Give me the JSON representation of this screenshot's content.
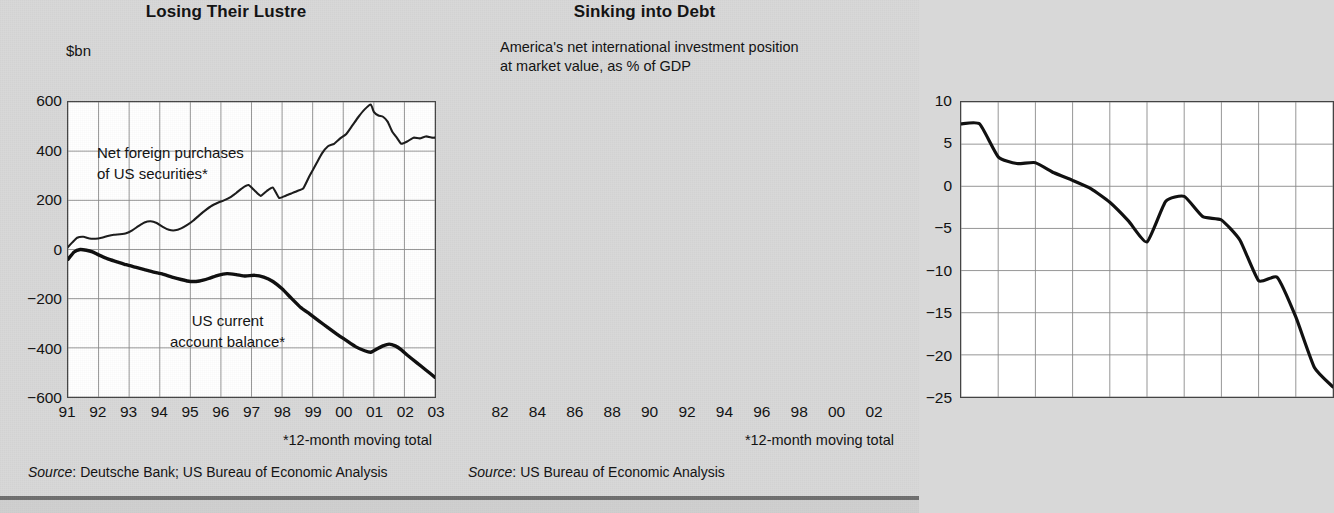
{
  "background_color": "#d8d8d8",
  "ink_color": "#111111",
  "grid_color": "#8a8a8a",
  "panels": [
    {
      "title": "Losing Their Lustre",
      "unit_label": "$bn",
      "footnote": "*12-month moving total",
      "source_prefix": "Source",
      "source_text": ": Deutsche Bank; US Bureau of Economic Analysis"
    },
    {
      "title": "Sinking into Debt",
      "subtitle_line1": "America's net international investment position",
      "subtitle_line2": "at market value, as % of GDP",
      "footnote": "*12-month moving total",
      "source_prefix": "Source",
      "source_text": ": US Bureau of Economic Analysis"
    }
  ],
  "chart_data": [
    {
      "type": "line",
      "title": "Losing Their Lustre",
      "ylabel": "$bn",
      "xlabel": "",
      "ylim": [
        -600,
        600
      ],
      "yticks": [
        600,
        400,
        200,
        0,
        -200,
        -400,
        -600
      ],
      "ytick_labels": [
        "600",
        "400",
        "200",
        "0",
        "−200",
        "−400",
        "−600"
      ],
      "xlim": [
        1991,
        2003
      ],
      "xticks": [
        1991,
        1992,
        1993,
        1994,
        1995,
        1996,
        1997,
        1998,
        1999,
        2000,
        2001,
        2002,
        2003
      ],
      "xtick_labels": [
        "91",
        "92",
        "93",
        "94",
        "95",
        "96",
        "97",
        "98",
        "99",
        "00",
        "01",
        "02",
        "03"
      ],
      "grid": true,
      "legend_position": "inline-annotation",
      "annotations": [
        {
          "text": "Net foreign purchases\nof US securities*",
          "x": 1993.3,
          "y": 400
        },
        {
          "text": "US current\naccount balance*",
          "x": 1995.6,
          "y": -290
        }
      ],
      "series": [
        {
          "name": "Net foreign purchases of US securities*",
          "label": "Net foreign purchases\nof US securities*",
          "units": "$bn, 12-month moving total",
          "x": [
            1991.0,
            1991.15,
            1991.3,
            1991.5,
            1991.7,
            1991.9,
            1992.1,
            1992.3,
            1992.5,
            1992.7,
            1992.9,
            1993.1,
            1993.3,
            1993.5,
            1993.7,
            1993.9,
            1994.1,
            1994.3,
            1994.5,
            1994.7,
            1994.9,
            1995.1,
            1995.3,
            1995.5,
            1995.7,
            1995.9,
            1996.1,
            1996.3,
            1996.5,
            1996.7,
            1996.9,
            1997.1,
            1997.3,
            1997.5,
            1997.7,
            1997.9,
            1998.1,
            1998.3,
            1998.5,
            1998.7,
            1998.9,
            1999.1,
            1999.3,
            1999.5,
            1999.7,
            1999.9,
            2000.1,
            2000.3,
            2000.5,
            2000.7,
            2000.9,
            2001.0,
            2001.15,
            2001.3,
            2001.45,
            2001.6,
            2001.75,
            2001.9,
            2002.1,
            2002.3,
            2002.5,
            2002.7,
            2002.9,
            2003.0
          ],
          "y": [
            10,
            30,
            48,
            52,
            45,
            44,
            48,
            55,
            60,
            62,
            66,
            78,
            95,
            110,
            115,
            108,
            92,
            80,
            78,
            86,
            100,
            118,
            140,
            160,
            178,
            190,
            200,
            212,
            230,
            250,
            262,
            240,
            218,
            238,
            252,
            210,
            218,
            228,
            238,
            250,
            300,
            345,
            390,
            420,
            430,
            452,
            470,
            505,
            540,
            570,
            590,
            560,
            545,
            540,
            520,
            480,
            455,
            430,
            440,
            455,
            452,
            460,
            455,
            455
          ]
        },
        {
          "name": "US current account balance*",
          "label": "US current\naccount balance*",
          "units": "$bn, 12-month moving total",
          "x": [
            1991.0,
            1991.2,
            1991.4,
            1991.6,
            1991.8,
            1992.0,
            1992.3,
            1992.6,
            1992.9,
            1993.2,
            1993.5,
            1993.8,
            1994.1,
            1994.4,
            1994.7,
            1995.0,
            1995.3,
            1995.6,
            1995.9,
            1996.2,
            1996.5,
            1996.8,
            1997.1,
            1997.4,
            1997.7,
            1998.0,
            1998.3,
            1998.6,
            1998.9,
            1999.2,
            1999.5,
            1999.8,
            2000.1,
            2000.4,
            2000.7,
            2000.9,
            2001.1,
            2001.3,
            2001.5,
            2001.7,
            2001.9,
            2002.1,
            2002.4,
            2002.7,
            2003.0
          ],
          "y": [
            -40,
            -10,
            0,
            -3,
            -10,
            -22,
            -38,
            -50,
            -62,
            -72,
            -82,
            -92,
            -100,
            -112,
            -122,
            -130,
            -128,
            -118,
            -105,
            -98,
            -102,
            -108,
            -105,
            -112,
            -130,
            -160,
            -198,
            -235,
            -262,
            -290,
            -318,
            -345,
            -370,
            -395,
            -412,
            -418,
            -405,
            -392,
            -385,
            -392,
            -408,
            -430,
            -460,
            -490,
            -520
          ]
        }
      ]
    },
    {
      "type": "line",
      "title": "Sinking into Debt",
      "subtitle": "America's net international investment position at market value, as % of GDP",
      "ylabel": "% of GDP",
      "xlabel": "",
      "ylim": [
        -25,
        10
      ],
      "yticks": [
        10,
        5,
        0,
        -5,
        -10,
        -15,
        -20,
        -25
      ],
      "ytick_labels": [
        "10",
        "5",
        "0",
        "−5",
        "−10",
        "−15",
        "−20",
        "−25"
      ],
      "xlim": [
        1982,
        2002
      ],
      "xticks": [
        1982,
        1984,
        1986,
        1988,
        1990,
        1992,
        1994,
        1996,
        1998,
        2000,
        2002
      ],
      "xtick_labels": [
        "82",
        "84",
        "86",
        "88",
        "90",
        "92",
        "94",
        "96",
        "98",
        "00",
        "02"
      ],
      "grid": true,
      "series": [
        {
          "name": "US net international investment position (% of GDP)",
          "x": [
            1982,
            1983,
            1984,
            1985,
            1986,
            1987,
            1988,
            1989,
            1990,
            1991,
            1992,
            1993,
            1994,
            1995,
            1996,
            1997,
            1998,
            1999,
            2000,
            2001,
            2002
          ],
          "y": [
            7.4,
            7.4,
            3.5,
            2.7,
            2.8,
            1.6,
            0.7,
            -0.3,
            -1.9,
            -4.1,
            -6.6,
            -1.8,
            -1.2,
            -3.6,
            -4.0,
            -6.4,
            -11.2,
            -10.8,
            -15.5,
            -21.5,
            -23.8
          ]
        }
      ]
    }
  ]
}
